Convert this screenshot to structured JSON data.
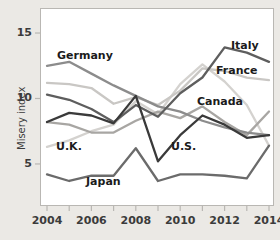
{
  "chart_data": {
    "type": "line",
    "title": "",
    "xlabel": "",
    "ylabel": "Misery index",
    "xlim": [
      2004,
      2014
    ],
    "ylim": [
      2.4,
      16.3
    ],
    "grid": false,
    "legend_position": "inline-annotations",
    "x": [
      2004,
      2005,
      2006,
      2007,
      2008,
      2009,
      2010,
      2011,
      2012,
      2013,
      2014
    ],
    "xticks": [
      2004,
      2005,
      2006,
      2007,
      2008,
      2009,
      2010,
      2011,
      2012,
      2013,
      2014
    ],
    "xtick_labels": [
      "2004",
      "2006",
      "2008",
      "2010",
      "2012",
      "2014"
    ],
    "xtick_label_values": [
      2004,
      2006,
      2008,
      2010,
      2012,
      2014
    ],
    "yticks": [
      5,
      10,
      15
    ],
    "ytick_labels": [
      "5",
      "10",
      "15"
    ],
    "series": [
      {
        "name": "Germany",
        "color": "#8c8c8c",
        "values": [
          12.5,
          12.8,
          11.9,
          11.0,
          10.2,
          9.4,
          9.0,
          8.3,
          7.8,
          7.4,
          7.2
        ]
      },
      {
        "name": "France",
        "color": "#c9c7c4",
        "values": [
          11.2,
          11.1,
          10.8,
          9.6,
          10.1,
          9.5,
          10.6,
          12.3,
          12.1,
          11.6,
          11.4
        ]
      },
      {
        "name": "Italy",
        "color": "#5e5e5e",
        "values": [
          10.3,
          9.9,
          9.2,
          8.2,
          9.5,
          8.6,
          10.4,
          11.6,
          13.9,
          13.5,
          12.8
        ]
      },
      {
        "name": "Canada",
        "color": "#a8a6a3",
        "values": [
          8.2,
          8.0,
          7.4,
          7.4,
          8.3,
          9.0,
          8.5,
          9.4,
          8.2,
          7.2,
          9.0
        ]
      },
      {
        "name": "U.K.",
        "color": "#d4d2cf",
        "values": [
          6.3,
          6.8,
          7.5,
          8.0,
          9.8,
          8.8,
          11.1,
          12.6,
          11.3,
          9.5,
          6.4
        ]
      },
      {
        "name": "U.S.",
        "color": "#3a3a3a",
        "values": [
          8.2,
          8.9,
          8.7,
          8.1,
          10.2,
          5.2,
          7.2,
          8.7,
          8.0,
          7.0,
          7.2
        ]
      },
      {
        "name": "Japan",
        "color": "#6b6b6b",
        "values": [
          4.2,
          3.7,
          4.1,
          4.1,
          6.2,
          3.7,
          4.2,
          4.2,
          4.1,
          3.9,
          6.4
        ]
      }
    ],
    "annotations": [
      {
        "text": "Germany",
        "x_px": 57,
        "y_px": 49,
        "series": "Germany"
      },
      {
        "text": "Italy",
        "x_px": 231,
        "y_px": 39,
        "series": "Italy"
      },
      {
        "text": "France",
        "x_px": 216,
        "y_px": 64,
        "series": "France"
      },
      {
        "text": "Canada",
        "x_px": 197,
        "y_px": 95,
        "series": "Canada"
      },
      {
        "text": "U.K.",
        "x_px": 56,
        "y_px": 140,
        "series": "U.K."
      },
      {
        "text": "U.S.",
        "x_px": 171,
        "y_px": 140,
        "series": "U.S."
      },
      {
        "text": "Japan",
        "x_px": 86,
        "y_px": 175,
        "series": "Japan"
      }
    ]
  },
  "axes": {
    "ylabel": "Misery index",
    "yticks": [
      {
        "label": "15",
        "value": 15
      },
      {
        "label": "10",
        "value": 10
      },
      {
        "label": "5",
        "value": 5
      }
    ],
    "xticks": [
      {
        "label": "2004",
        "value": 2004
      },
      {
        "label": "2006",
        "value": 2006
      },
      {
        "label": "2008",
        "value": 2008
      },
      {
        "label": "2010",
        "value": 2010
      },
      {
        "label": "2012",
        "value": 2012
      },
      {
        "label": "2014",
        "value": 2014
      }
    ]
  },
  "colors": {
    "background": "#ebe9e5",
    "plot_background": "#ffffff",
    "frame": "#b9b7b3",
    "text": "#3b3b3b"
  }
}
